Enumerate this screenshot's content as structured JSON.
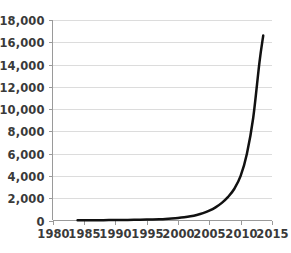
{
  "chart_data": {
    "type": "line",
    "title": "",
    "subtitle": "",
    "xlabel": "",
    "ylabel": "",
    "grid": "horizontal",
    "legend": "none",
    "xlim": [
      1980,
      2015
    ],
    "ylim": [
      0,
      18000
    ],
    "xticks": [
      1980,
      1985,
      1990,
      1995,
      2000,
      2005,
      2010,
      2015
    ],
    "xtick_labels": [
      "1980",
      "1985",
      "1990",
      "1995",
      "2000",
      "2005",
      "2010",
      "2015"
    ],
    "yticks": [
      0,
      2000,
      4000,
      6000,
      8000,
      10000,
      12000,
      14000,
      16000,
      18000
    ],
    "ytick_labels": [
      "0",
      "2,000",
      "4,000",
      "6,000",
      "8,000",
      "10,000",
      "12,000",
      "14,000",
      "16,000",
      "18,000"
    ],
    "series": [
      {
        "name": "series-1",
        "color": "#111111",
        "x": [
          1984,
          1985,
          1986,
          1987,
          1988,
          1989,
          1990,
          1991,
          1992,
          1993,
          1994,
          1995,
          1996,
          1997,
          1998,
          1999,
          2000,
          2001,
          2002,
          2003,
          2004,
          2005,
          2006,
          2007,
          2008,
          2009,
          2010,
          2011,
          2012,
          2013,
          2013.6
        ],
        "values": [
          20,
          22,
          25,
          28,
          32,
          36,
          41,
          47,
          54,
          62,
          72,
          84,
          100,
          120,
          145,
          180,
          225,
          290,
          380,
          500,
          660,
          880,
          1180,
          1580,
          2120,
          2850,
          4000,
          6000,
          9200,
          14200,
          16600
        ]
      }
    ],
    "colors": {
      "line": "#111111",
      "grid": "#d8d8d8",
      "axis": "#9a9a9a",
      "text": "#3a3a3a",
      "background": "#ffffff"
    }
  }
}
